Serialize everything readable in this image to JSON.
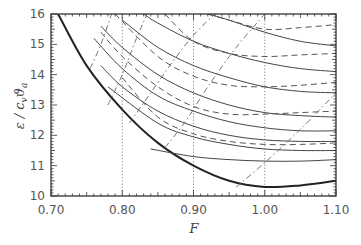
{
  "chart_data": {
    "type": "line",
    "title": "",
    "xlabel": "F",
    "ylabel": "ε / c_v ϑ_a",
    "xlim": [
      0.7,
      1.1
    ],
    "ylim": [
      10,
      16
    ],
    "xticks": [
      "0.70",
      "0.80",
      "0.90",
      "1.00",
      "1.10"
    ],
    "yticks": [
      "10",
      "11",
      "12",
      "13",
      "14",
      "15",
      "16"
    ],
    "grid": false,
    "legend": null,
    "vertical_reference_lines": [
      0.8,
      0.9,
      1.0
    ],
    "series": [
      {
        "name": "envelope (thick)",
        "style": "solid-thick",
        "x": [
          0.71,
          0.75,
          0.8,
          0.85,
          0.9,
          0.95,
          1.0,
          1.05,
          1.1
        ],
        "y": [
          16.0,
          14.3,
          12.85,
          11.75,
          11.0,
          10.5,
          10.3,
          10.35,
          10.5
        ]
      },
      {
        "name": "solid 1",
        "style": "solid",
        "x": [
          0.84,
          0.9,
          0.95,
          1.0,
          1.05,
          1.1
        ],
        "y": [
          11.55,
          11.3,
          11.2,
          11.15,
          11.15,
          11.2
        ]
      },
      {
        "name": "solid 2",
        "style": "solid",
        "x": [
          0.78,
          0.85,
          0.9,
          0.95,
          1.0,
          1.05,
          1.1
        ],
        "y": [
          13.6,
          12.4,
          11.95,
          11.7,
          11.55,
          11.5,
          11.5
        ]
      },
      {
        "name": "solid 3",
        "style": "solid",
        "x": [
          0.77,
          0.8,
          0.85,
          0.9,
          0.95,
          1.0,
          1.05,
          1.1
        ],
        "y": [
          14.3,
          13.6,
          12.8,
          12.3,
          12.0,
          11.85,
          11.8,
          11.8
        ]
      },
      {
        "name": "solid 4",
        "style": "solid",
        "x": [
          0.76,
          0.8,
          0.85,
          0.9,
          0.95,
          1.0,
          1.05,
          1.1
        ],
        "y": [
          15.2,
          14.2,
          13.3,
          12.8,
          12.45,
          12.25,
          12.15,
          12.15
        ]
      },
      {
        "name": "solid 5",
        "style": "solid",
        "x": [
          0.77,
          0.8,
          0.85,
          0.9,
          0.95,
          1.0,
          1.05,
          1.1
        ],
        "y": [
          15.6,
          14.9,
          14.0,
          13.4,
          13.0,
          12.75,
          12.65,
          12.6
        ]
      },
      {
        "name": "solid 6",
        "style": "solid",
        "x": [
          0.8,
          0.85,
          0.9,
          0.95,
          1.0,
          1.05,
          1.1
        ],
        "y": [
          15.8,
          14.9,
          14.3,
          13.9,
          13.6,
          13.45,
          13.4
        ]
      },
      {
        "name": "solid 7",
        "style": "solid",
        "x": [
          0.83,
          0.85,
          0.9,
          0.95,
          1.0,
          1.05,
          1.1
        ],
        "y": [
          16.0,
          15.7,
          15.1,
          14.7,
          14.4,
          14.2,
          14.1
        ]
      },
      {
        "name": "solid 8",
        "style": "solid",
        "x": [
          0.92,
          0.95,
          1.0,
          1.05,
          1.1
        ],
        "y": [
          16.0,
          15.8,
          15.4,
          15.1,
          14.95
        ]
      },
      {
        "name": "dashed 1",
        "style": "dashed",
        "x": [
          0.8,
          0.85,
          0.9,
          0.95,
          1.0,
          1.05,
          1.1
        ],
        "y": [
          13.9,
          12.6,
          12.05,
          11.8,
          11.7,
          11.7,
          11.75
        ]
      },
      {
        "name": "dashed 2",
        "style": "dashed",
        "x": [
          0.77,
          0.8,
          0.85,
          0.9,
          0.95,
          1.0,
          1.05,
          1.1
        ],
        "y": [
          15.4,
          14.6,
          13.6,
          12.95,
          12.7,
          12.7,
          12.75,
          12.8
        ]
      },
      {
        "name": "dashed 3",
        "style": "dashed",
        "x": [
          0.79,
          0.85,
          0.9,
          0.95,
          1.0,
          1.05,
          1.1
        ],
        "y": [
          16.0,
          14.6,
          13.95,
          13.65,
          13.6,
          13.65,
          13.75
        ]
      },
      {
        "name": "dashed 4",
        "style": "dashed",
        "x": [
          0.86,
          0.9,
          0.95,
          1.0,
          1.05,
          1.1
        ],
        "y": [
          16.0,
          15.1,
          14.7,
          14.6,
          14.65,
          14.7
        ]
      },
      {
        "name": "dashed 5",
        "style": "dashed",
        "x": [
          0.92,
          0.95,
          1.0,
          1.05,
          1.1
        ],
        "y": [
          16.0,
          15.8,
          15.5,
          15.55,
          15.65
        ]
      },
      {
        "name": "dash-dot 1",
        "style": "dashdot",
        "x": [
          0.755,
          0.77,
          0.785
        ],
        "y": [
          14.2,
          15.0,
          16.0
        ]
      },
      {
        "name": "dash-dot 2",
        "style": "dashdot",
        "x": [
          0.78,
          0.8,
          0.82,
          0.835
        ],
        "y": [
          13.0,
          14.0,
          15.2,
          16.0
        ]
      },
      {
        "name": "dash-dot 3",
        "style": "dashdot",
        "x": [
          0.81,
          0.84,
          0.87,
          0.9,
          0.93
        ],
        "y": [
          12.4,
          13.4,
          14.4,
          15.3,
          16.0
        ]
      },
      {
        "name": "dash-dot 4",
        "style": "dashdot",
        "x": [
          0.86,
          0.89,
          0.92,
          0.96,
          1.0
        ],
        "y": [
          11.6,
          12.5,
          13.6,
          14.9,
          16.0
        ]
      },
      {
        "name": "dash-dot 5",
        "style": "dashdot",
        "x": [
          0.96,
          1.0,
          1.05,
          1.1
        ],
        "y": [
          10.3,
          11.1,
          12.2,
          13.4
        ]
      }
    ]
  }
}
